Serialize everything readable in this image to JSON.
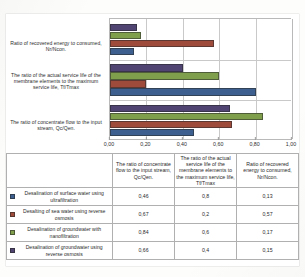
{
  "chart_data": {
    "type": "bar",
    "orientation": "horizontal",
    "title": "",
    "xlabel": "",
    "ylabel": "",
    "xlim": [
      0,
      1.0
    ],
    "xticks": [
      "0,00",
      "0,20",
      "0,40",
      "0,60",
      "0,80",
      "1,00"
    ],
    "xtick_values": [
      0,
      0.2,
      0.4,
      0.6,
      0.8,
      1.0
    ],
    "grid": true,
    "legend_position": "table-below",
    "categories": [
      "The ratio of concentrate flow to the input stream, Qc/Qen.",
      "The ratio of the actual service life of the membrane elements to the maximum service life, Tf/Tmax",
      "Ratio of recovered energy to consumed, Nr/Ncon."
    ],
    "series": [
      {
        "name": "Desalination of surface water using ultrafiltration",
        "color": "#3c5f8f",
        "values": [
          0.46,
          0.8,
          0.13
        ]
      },
      {
        "name": "Desalting of sea water using reverse osmosis",
        "color": "#9e4b3c",
        "values": [
          0.67,
          0.2,
          0.57
        ]
      },
      {
        "name": "Desalination of groundwater with nanofiltration",
        "color": "#7f9f4c",
        "values": [
          0.84,
          0.6,
          0.17
        ]
      },
      {
        "name": "Desalination of groundwater using reverse osmosis",
        "color": "#4f4472",
        "values": [
          0.66,
          0.4,
          0.15
        ]
      }
    ]
  },
  "chart": {
    "category_labels": [
      "Ratio of recovered energy to consumed, Nr/Ncon.",
      "The ratio of the actual service life of the membrane elements to the maximum service life, Tf/Tmax",
      "The ratio of concentrate flow to the input stream, Qc/Qen."
    ],
    "axis_ticks": [
      "0,00",
      "0,20",
      "0,40",
      "0,60",
      "0,80",
      "1,00"
    ]
  },
  "table": {
    "headers": [
      "",
      "The ratio of concentrate flow to the input stream, Qc/Qen.",
      "The ratio of the actual service life of the membrane elements to the maximum service life, Tf/Tmax",
      "Ratio of recovered energy to consumed, Nr/Ncon."
    ],
    "rows": [
      {
        "label": "Desalination of surface water using ultrafiltration",
        "color": "#3c5f8f",
        "cells": [
          "0,46",
          "0,8",
          "0,13"
        ]
      },
      {
        "label": "Desalting of sea water using reverse osmosis",
        "color": "#9e4b3c",
        "cells": [
          "0,67",
          "0,2",
          "0,57"
        ]
      },
      {
        "label": "Desalination of groundwater with nanofiltration",
        "color": "#7f9f4c",
        "cells": [
          "0,84",
          "0,6",
          "0,17"
        ]
      },
      {
        "label": "Desalination of groundwater using reverse osmosis",
        "color": "#4f4472",
        "cells": [
          "0,66",
          "0,4",
          "0,15"
        ]
      }
    ]
  }
}
